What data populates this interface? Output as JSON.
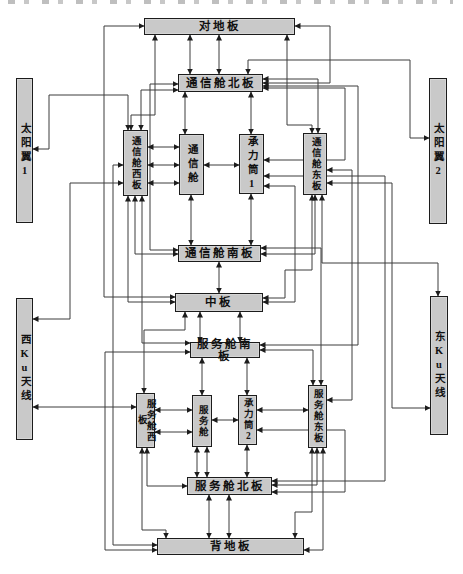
{
  "diagram": {
    "name": "satellite-thermal-network-diagram",
    "colors": {
      "background": "#ffffff",
      "box_fill": "#c9c9c9",
      "box_border": "#1c1c1c",
      "line": "#3c3c3c",
      "text": "#111111"
    },
    "nodes": [
      {
        "id": "duidiban",
        "label": "对地板",
        "x": 144,
        "y": 18,
        "w": 151,
        "h": 17,
        "v": false
      },
      {
        "id": "tongxincang-beiban",
        "label": "通信舱北板",
        "x": 178,
        "y": 74,
        "w": 85,
        "h": 18,
        "v": false
      },
      {
        "id": "taiyangyi-1",
        "label": "太阳翼1",
        "x": 16,
        "y": 78,
        "w": 17,
        "h": 145,
        "v": true,
        "big": true
      },
      {
        "id": "tongxincang-xiban",
        "label": "通信舱西板",
        "x": 123,
        "y": 130,
        "w": 25,
        "h": 66,
        "v": true
      },
      {
        "id": "tongxincang",
        "label": "通信舱",
        "x": 179,
        "y": 134,
        "w": 25,
        "h": 61,
        "v": true,
        "big": true
      },
      {
        "id": "chenglitong-1",
        "label": "承力筒1",
        "x": 239,
        "y": 134,
        "w": 25,
        "h": 60,
        "v": true,
        "big": true
      },
      {
        "id": "tongxincang-dongban",
        "label": "通信舱东板",
        "x": 303,
        "y": 133,
        "w": 24,
        "h": 62,
        "v": true
      },
      {
        "id": "taiyangyi-2",
        "label": "太阳翼2",
        "x": 429,
        "y": 78,
        "w": 18,
        "h": 146,
        "v": true,
        "big": true
      },
      {
        "id": "tongxincang-nanban",
        "label": "通信舱南板",
        "x": 178,
        "y": 245,
        "w": 83,
        "h": 17,
        "v": false
      },
      {
        "id": "zhongban",
        "label": "中板",
        "x": 175,
        "y": 293,
        "w": 88,
        "h": 19,
        "v": false
      },
      {
        "id": "xi-ku-tianxian",
        "label": "西Ku天线",
        "x": 16,
        "y": 298,
        "w": 17,
        "h": 142,
        "v": true,
        "big": true
      },
      {
        "id": "dong-ku-tianxian",
        "label": "东Ku天线",
        "x": 430,
        "y": 296,
        "w": 18,
        "h": 139,
        "v": true,
        "big": true
      },
      {
        "id": "fuwucang-nanban",
        "label": "服务舱南板",
        "x": 190,
        "y": 342,
        "w": 70,
        "h": 16,
        "v": false
      },
      {
        "id": "fuwucang-xiban",
        "label": "服务舱西板",
        "x": 136,
        "y": 393,
        "w": 19,
        "h": 55,
        "v": true
      },
      {
        "id": "fuwucang",
        "label": "服务舱",
        "x": 192,
        "y": 395,
        "w": 20,
        "h": 52,
        "v": true
      },
      {
        "id": "chenglitong-2",
        "label": "承力筒2",
        "x": 238,
        "y": 395,
        "w": 19,
        "h": 50,
        "v": true
      },
      {
        "id": "fuwucang-dongban",
        "label": "服务舱东板",
        "x": 308,
        "y": 385,
        "w": 19,
        "h": 63,
        "v": true
      },
      {
        "id": "fuwucang-beiban",
        "label": "服务舱北板",
        "x": 187,
        "y": 477,
        "w": 85,
        "h": 18,
        "v": false
      },
      {
        "id": "beidiban",
        "label": "背地板",
        "x": 157,
        "y": 538,
        "w": 147,
        "h": 17,
        "v": false
      }
    ],
    "edges": [
      {
        "points": [
          [
            219,
            35
          ],
          [
            219,
            74
          ]
        ],
        "arrows": "both"
      },
      {
        "points": [
          [
            190,
            35
          ],
          [
            190,
            74
          ]
        ],
        "arrows": "both"
      },
      {
        "points": [
          [
            155,
            35
          ],
          [
            155,
            115
          ],
          [
            131,
            115
          ],
          [
            131,
            130
          ]
        ],
        "arrows": "both"
      },
      {
        "points": [
          [
            287,
            35
          ],
          [
            287,
            125
          ],
          [
            312,
            125
          ],
          [
            312,
            133
          ]
        ],
        "arrows": "both"
      },
      {
        "points": [
          [
            144,
            26
          ],
          [
            104,
            26
          ],
          [
            104,
            297
          ],
          [
            175,
            297
          ]
        ],
        "arrows": "both"
      },
      {
        "points": [
          [
            295,
            26
          ],
          [
            330,
            26
          ],
          [
            330,
            83
          ],
          [
            263,
            83
          ]
        ],
        "arrows": "both"
      },
      {
        "points": [
          [
            263,
            79
          ],
          [
            318,
            79
          ],
          [
            318,
            133
          ]
        ],
        "arrows": "both"
      },
      {
        "points": [
          [
            178,
            90
          ],
          [
            141,
            90
          ],
          [
            141,
            130
          ]
        ],
        "arrows": "both"
      },
      {
        "points": [
          [
            263,
            88
          ],
          [
            345,
            88
          ],
          [
            345,
            160
          ],
          [
            264,
            160
          ]
        ],
        "arrows": "both"
      },
      {
        "points": [
          [
            322,
            195
          ],
          [
            322,
            263
          ],
          [
            438,
            263
          ],
          [
            438,
            296
          ]
        ],
        "arrows": "both"
      },
      {
        "points": [
          [
            178,
            84
          ],
          [
            150,
            84
          ],
          [
            150,
            250
          ],
          [
            178,
            250
          ]
        ],
        "arrows": "both"
      },
      {
        "points": [
          [
            263,
            86
          ],
          [
            358,
            86
          ],
          [
            358,
            345
          ],
          [
            260,
            345
          ]
        ],
        "arrows": "both"
      },
      {
        "points": [
          [
            33,
            149
          ],
          [
            49,
            149
          ],
          [
            49,
            95
          ],
          [
            128,
            95
          ],
          [
            128,
            130
          ]
        ],
        "arrows": "both"
      },
      {
        "points": [
          [
            248,
            74
          ],
          [
            248,
            60
          ],
          [
            410,
            60
          ],
          [
            410,
            138
          ],
          [
            429,
            138
          ]
        ],
        "arrows": "both"
      },
      {
        "points": [
          [
            185,
            92
          ],
          [
            185,
            134
          ]
        ],
        "arrows": "both"
      },
      {
        "points": [
          [
            251,
            92
          ],
          [
            251,
            134
          ]
        ],
        "arrows": "both"
      },
      {
        "points": [
          [
            148,
            147
          ],
          [
            179,
            147
          ]
        ],
        "arrows": "both"
      },
      {
        "points": [
          [
            148,
            165
          ],
          [
            179,
            165
          ]
        ],
        "arrows": "both"
      },
      {
        "points": [
          [
            148,
            183
          ],
          [
            179,
            183
          ]
        ],
        "arrows": "both"
      },
      {
        "points": [
          [
            204,
            165
          ],
          [
            239,
            165
          ]
        ],
        "arrows": "both"
      },
      {
        "points": [
          [
            264,
            176
          ],
          [
            385,
            176
          ],
          [
            385,
            481
          ],
          [
            272,
            481
          ]
        ],
        "arrows": "both"
      },
      {
        "points": [
          [
            264,
            186
          ],
          [
            295,
            186
          ],
          [
            295,
            302
          ],
          [
            263,
            302
          ]
        ],
        "arrows": "both"
      },
      {
        "points": [
          [
            123,
            165
          ],
          [
            113,
            165
          ],
          [
            113,
            545
          ],
          [
            157,
            545
          ]
        ],
        "arrows": "both"
      },
      {
        "points": [
          [
            123,
            183
          ],
          [
            70,
            183
          ],
          [
            70,
            319
          ],
          [
            33,
            319
          ]
        ],
        "arrows": "both"
      },
      {
        "points": [
          [
            135,
            196
          ],
          [
            135,
            254
          ],
          [
            178,
            254
          ]
        ],
        "arrows": "both"
      },
      {
        "points": [
          [
            128,
            196
          ],
          [
            128,
            302
          ],
          [
            175,
            302
          ]
        ],
        "arrows": "both"
      },
      {
        "points": [
          [
            191,
            195
          ],
          [
            191,
            245
          ]
        ],
        "arrows": "both"
      },
      {
        "points": [
          [
            251,
            194
          ],
          [
            251,
            245
          ]
        ],
        "arrows": "both"
      },
      {
        "points": [
          [
            315,
            195
          ],
          [
            315,
            254
          ],
          [
            261,
            254
          ]
        ],
        "arrows": "both"
      },
      {
        "points": [
          [
            312,
            195
          ],
          [
            312,
            270
          ],
          [
            285,
            270
          ],
          [
            285,
            298
          ],
          [
            263,
            298
          ]
        ],
        "arrows": "both"
      },
      {
        "points": [
          [
            219,
            262
          ],
          [
            219,
            293
          ]
        ],
        "arrows": "both"
      },
      {
        "points": [
          [
            261,
            248
          ],
          [
            321,
            248
          ],
          [
            321,
            385
          ]
        ],
        "arrows": "both"
      },
      {
        "points": [
          [
            327,
            170
          ],
          [
            352,
            170
          ],
          [
            352,
            400
          ],
          [
            327,
            400
          ]
        ],
        "arrows": "both"
      },
      {
        "points": [
          [
            327,
            183
          ],
          [
            392,
            183
          ],
          [
            392,
            408
          ],
          [
            430,
            408
          ]
        ],
        "arrows": "both"
      },
      {
        "points": [
          [
            200,
            312
          ],
          [
            200,
            342
          ]
        ],
        "arrows": "both"
      },
      {
        "points": [
          [
            240,
            312
          ],
          [
            240,
            342
          ]
        ],
        "arrows": "both"
      },
      {
        "points": [
          [
            185,
            312
          ],
          [
            185,
            330
          ],
          [
            144,
            330
          ],
          [
            144,
            393
          ]
        ],
        "arrows": "both"
      },
      {
        "points": [
          [
            142,
            196
          ],
          [
            142,
            343
          ],
          [
            190,
            343
          ]
        ],
        "arrows": "both"
      },
      {
        "points": [
          [
            157,
            550
          ],
          [
            105,
            550
          ],
          [
            105,
            352
          ],
          [
            190,
            352
          ]
        ],
        "arrows": "both"
      },
      {
        "points": [
          [
            33,
            407
          ],
          [
            136,
            407
          ]
        ],
        "arrows": "both"
      },
      {
        "points": [
          [
            202,
            358
          ],
          [
            202,
            395
          ]
        ],
        "arrows": "both"
      },
      {
        "points": [
          [
            247,
            358
          ],
          [
            247,
            395
          ]
        ],
        "arrows": "both"
      },
      {
        "points": [
          [
            260,
            350
          ],
          [
            313,
            350
          ],
          [
            313,
            385
          ]
        ],
        "arrows": "both"
      },
      {
        "points": [
          [
            155,
            410
          ],
          [
            192,
            410
          ]
        ],
        "arrows": "both"
      },
      {
        "points": [
          [
            155,
            432
          ],
          [
            192,
            432
          ]
        ],
        "arrows": "both"
      },
      {
        "points": [
          [
            212,
            420
          ],
          [
            238,
            420
          ]
        ],
        "arrows": "both"
      },
      {
        "points": [
          [
            257,
            410
          ],
          [
            308,
            410
          ]
        ],
        "arrows": "both"
      },
      {
        "points": [
          [
            257,
            430
          ],
          [
            345,
            430
          ],
          [
            345,
            492
          ],
          [
            272,
            492
          ]
        ],
        "arrows": "both"
      },
      {
        "points": [
          [
            247,
            445
          ],
          [
            247,
            477
          ]
        ],
        "arrows": "both"
      },
      {
        "points": [
          [
            197,
            447
          ],
          [
            197,
            477
          ]
        ],
        "arrows": "both"
      },
      {
        "points": [
          [
            207,
            447
          ],
          [
            207,
            477
          ]
        ],
        "arrows": "both"
      },
      {
        "points": [
          [
            147,
            448
          ],
          [
            147,
            486
          ],
          [
            187,
            486
          ]
        ],
        "arrows": "both"
      },
      {
        "points": [
          [
            142,
            448
          ],
          [
            142,
            530
          ],
          [
            166,
            530
          ],
          [
            166,
            538
          ]
        ],
        "arrows": "both"
      },
      {
        "points": [
          [
            317,
            448
          ],
          [
            317,
            485
          ],
          [
            272,
            485
          ]
        ],
        "arrows": "both"
      },
      {
        "points": [
          [
            312,
            448
          ],
          [
            312,
            512
          ],
          [
            295,
            512
          ],
          [
            295,
            538
          ]
        ],
        "arrows": "both"
      },
      {
        "points": [
          [
            323,
            448
          ],
          [
            323,
            550
          ],
          [
            304,
            550
          ]
        ],
        "arrows": "both"
      },
      {
        "points": [
          [
            209,
            495
          ],
          [
            209,
            538
          ]
        ],
        "arrows": "both"
      },
      {
        "points": [
          [
            229,
            495
          ],
          [
            229,
            538
          ]
        ],
        "arrows": "both"
      }
    ]
  }
}
